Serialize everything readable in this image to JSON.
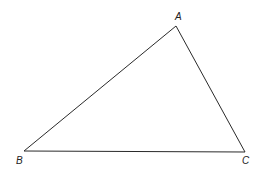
{
  "diagram": {
    "type": "triangle",
    "vertices": [
      {
        "label": "A",
        "x": 176,
        "y": 26,
        "label_x": 175,
        "label_y": 20
      },
      {
        "label": "B",
        "x": 24,
        "y": 151,
        "label_x": 16,
        "label_y": 164
      },
      {
        "label": "C",
        "x": 245,
        "y": 152,
        "label_x": 242,
        "label_y": 164
      }
    ],
    "stroke_color": "#2a2a2a"
  }
}
